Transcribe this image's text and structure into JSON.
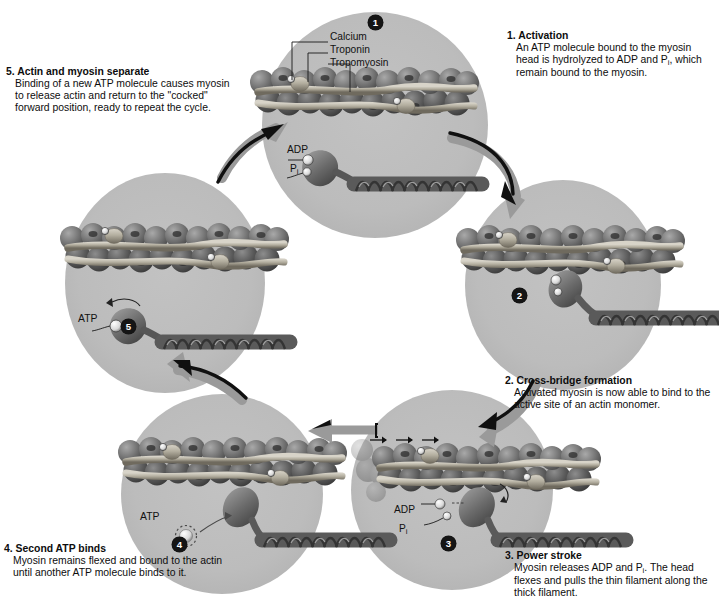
{
  "diagram": {
    "bg_color": "#ffffff",
    "panel_color": "#b9b9b9",
    "arrow_gray": "#9a9a9a",
    "arrow_black": "#101010",
    "badge_color": "#151515"
  },
  "steps": [
    {
      "id": 1,
      "badge": "1",
      "heading": "1. Activation",
      "body": "An ATP molecule bound to the myosin head is hydrolyzed to ADP and P",
      "body_sub": "i",
      "body_tail": ", which remain bound to the myosin.",
      "labels": [
        "Calcium",
        "Troponin",
        "Tropomyosin",
        "ADP",
        "P"
      ]
    },
    {
      "id": 2,
      "badge": "2",
      "heading": "2. Cross-bridge formation",
      "body": "Activated myosin is now able to bind to the active site of an actin monomer.",
      "labels": []
    },
    {
      "id": 3,
      "badge": "3",
      "heading": "3. Power stroke",
      "body": "Myosin releases ADP and P",
      "body_sub": "i",
      "body_tail": ". The head flexes and pulls the thin filament along the thick filament.",
      "labels": [
        "ADP",
        "P"
      ]
    },
    {
      "id": 4,
      "badge": "4",
      "heading": "4. Second ATP binds",
      "body": "Myosin remains flexed and bound to the actin until another ATP molecule binds to it.",
      "labels": [
        "ATP"
      ]
    },
    {
      "id": 5,
      "badge": "5",
      "heading": "5. Actin and myosin separate",
      "body": "Binding of a new ATP molecule causes myosin to release actin and return to the \"cocked\" forward position, ready to repeat the cycle.",
      "labels": [
        "ATP"
      ]
    }
  ],
  "panel1_labels": {
    "calcium": "Calcium",
    "troponin": "Troponin",
    "tropomyosin": "Tropomyosin",
    "adp": "ADP",
    "pi": "P",
    "pi_sub": "i"
  },
  "panel3_labels": {
    "adp": "ADP",
    "pi": "P",
    "pi_sub": "i"
  },
  "panel4_labels": {
    "atp": "ATP"
  },
  "panel5_labels": {
    "atp": "ATP"
  },
  "badges": {
    "b1": "1",
    "b2": "2",
    "b3": "3",
    "b4": "4",
    "b5": "5"
  }
}
